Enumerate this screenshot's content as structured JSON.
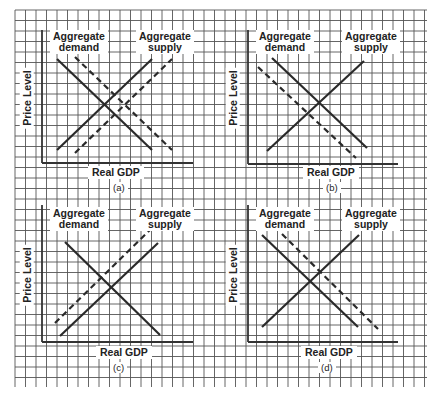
{
  "figure": {
    "background": "#ffffff",
    "grid": {
      "x0": 15,
      "y0": 10,
      "x1": 427,
      "y1": 387,
      "spacing": 10.5,
      "color": "#555555"
    },
    "curve_color": "#2a2a2a",
    "axis_color": "#333333"
  },
  "panels": [
    {
      "id": "a",
      "caption": "(a)",
      "xlabel": "Real GDP",
      "ylabel": "Price Level",
      "demand_label": "Aggregate\ndemand",
      "supply_label": "Aggregate\nsupply",
      "axis": {
        "x0": 42,
        "y_top": 30,
        "y_axis": 163,
        "x_end": 193
      },
      "labels": {
        "demand": [
          50,
          30
        ],
        "supply": [
          136,
          30
        ],
        "xlabel": [
          88,
          166
        ],
        "caption": [
          110,
          182
        ],
        "ylabel": [
          24,
          98
        ]
      },
      "curves": [
        {
          "name": "aggregate-demand",
          "style": "solid",
          "from": [
            57,
            59
          ],
          "to": [
            152,
            150
          ]
        },
        {
          "name": "aggregate-demand-shifted",
          "style": "dashed",
          "from": [
            75,
            57
          ],
          "to": [
            172,
            150
          ]
        },
        {
          "name": "aggregate-supply",
          "style": "solid",
          "from": [
            57,
            150
          ],
          "to": [
            152,
            59
          ]
        },
        {
          "name": "aggregate-supply-shifted",
          "style": "dashed",
          "from": [
            75,
            153
          ],
          "to": [
            172,
            59
          ]
        }
      ]
    },
    {
      "id": "b",
      "caption": "(b)",
      "xlabel": "Real GDP",
      "ylabel": "Price Level",
      "demand_label": "Aggregate\ndemand",
      "supply_label": "Aggregate\nsupply",
      "axis": {
        "x0": 248,
        "y_top": 30,
        "y_axis": 164,
        "x_end": 398
      },
      "labels": {
        "demand": [
          256,
          30
        ],
        "supply": [
          342,
          30
        ],
        "xlabel": [
          303,
          166
        ],
        "caption": [
          323,
          182
        ],
        "ylabel": [
          230,
          98
        ]
      },
      "curves": [
        {
          "name": "aggregate-demand",
          "style": "solid",
          "from": [
            272,
            58
          ],
          "to": [
            367,
            148
          ]
        },
        {
          "name": "aggregate-demand-shifted",
          "style": "dashed",
          "from": [
            258,
            67
          ],
          "to": [
            356,
            158
          ]
        },
        {
          "name": "aggregate-supply",
          "style": "solid",
          "from": [
            267,
            151
          ],
          "to": [
            364,
            61
          ]
        }
      ]
    },
    {
      "id": "c",
      "caption": "(c)",
      "xlabel": "Real GDP",
      "ylabel": "Price Level",
      "demand_label": "Aggregate\ndemand",
      "supply_label": "Aggregate\nsupply",
      "axis": {
        "x0": 42,
        "y_top": 205,
        "y_axis": 342,
        "x_end": 193
      },
      "labels": {
        "demand": [
          50,
          207
        ],
        "supply": [
          136,
          207
        ],
        "xlabel": [
          96,
          346
        ],
        "caption": [
          110,
          362
        ],
        "ylabel": [
          24,
          275
        ]
      },
      "curves": [
        {
          "name": "aggregate-demand",
          "style": "solid",
          "from": [
            65,
            242
          ],
          "to": [
            160,
            335
          ]
        },
        {
          "name": "aggregate-supply",
          "style": "solid",
          "from": [
            60,
            336
          ],
          "to": [
            158,
            243
          ]
        },
        {
          "name": "aggregate-supply-shifted",
          "style": "dashed",
          "from": [
            55,
            323
          ],
          "to": [
            152,
            228
          ]
        }
      ]
    },
    {
      "id": "d",
      "caption": "(d)",
      "xlabel": "Real GDP",
      "ylabel": "Price Level",
      "demand_label": "Aggregate\ndemand",
      "supply_label": "Aggregate\nsupply",
      "axis": {
        "x0": 248,
        "y_top": 205,
        "y_axis": 342,
        "x_end": 398
      },
      "labels": {
        "demand": [
          256,
          207
        ],
        "supply": [
          342,
          207
        ],
        "xlabel": [
          301,
          346
        ],
        "caption": [
          318,
          362
        ],
        "ylabel": [
          230,
          275
        ]
      },
      "curves": [
        {
          "name": "aggregate-demand",
          "style": "solid",
          "from": [
            262,
            235
          ],
          "to": [
            358,
            327
          ]
        },
        {
          "name": "aggregate-demand-shifted",
          "style": "dashed",
          "from": [
            282,
            234
          ],
          "to": [
            378,
            329
          ]
        },
        {
          "name": "aggregate-supply",
          "style": "solid",
          "from": [
            262,
            327
          ],
          "to": [
            359,
            235
          ]
        }
      ]
    }
  ]
}
